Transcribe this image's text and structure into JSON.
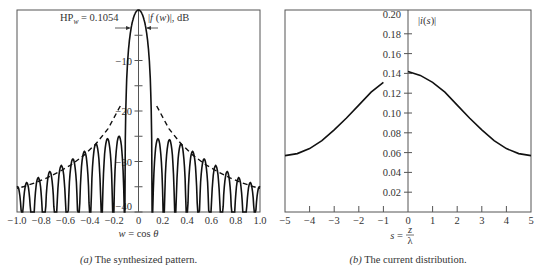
{
  "chart_data": [
    {
      "id": "a",
      "type": "line",
      "title": "",
      "caption_prefix": "(a)",
      "caption": " The synthesized pattern.",
      "xlabel": "w = cos θ",
      "ylabel": "|f (w)|, dB",
      "annotation": "HP_w = 0.1054",
      "xlim": [
        -1.0,
        1.0
      ],
      "ylim": [
        -40,
        0
      ],
      "xticks": [
        "-1.0",
        "-0.8",
        "-0.6",
        "-0.4",
        "-0.2",
        "0",
        "0.2",
        "0.4",
        "0.6",
        "0.8",
        "1.0"
      ],
      "yticks": [
        {
          "value": -10,
          "label": "-10"
        },
        {
          "value": -20,
          "label": "-20"
        },
        {
          "value": -30,
          "label": "-30"
        },
        {
          "value": -40,
          "label": "-40"
        }
      ],
      "minor_yticks": [
        -5,
        -15,
        -25,
        -35
      ],
      "grid": false,
      "main_lobe": {
        "first_null": 0.11,
        "peak_db": 0,
        "half_power_beamwidth": 0.1054
      },
      "sidelobes_right": {
        "centers": [
          0.16,
          0.255,
          0.35,
          0.445,
          0.54,
          0.635,
          0.73,
          0.825,
          0.92,
          0.995
        ],
        "peak_db": [
          -25.5,
          -25.7,
          -26.5,
          -28.0,
          -29.5,
          -30.8,
          -32.0,
          -33.2,
          -34.2,
          -35.0
        ]
      },
      "sidelobes_left": {
        "centers": [
          -0.16,
          -0.255,
          -0.35,
          -0.445,
          -0.54,
          -0.635,
          -0.73,
          -0.825,
          -0.92,
          -0.995
        ],
        "peak_db": [
          -25.0,
          -25.5,
          -26.5,
          -28.0,
          -29.5,
          -30.8,
          -32.0,
          -33.2,
          -34.2,
          -35.0
        ]
      },
      "envelope": {
        "style": "dashed",
        "x": [
          0.15,
          0.25,
          0.35,
          0.45,
          0.55,
          0.65,
          0.75,
          0.85,
          0.95,
          1.0
        ],
        "db": [
          -19.0,
          -23.5,
          -26.5,
          -28.8,
          -30.6,
          -32.0,
          -33.2,
          -34.2,
          -35.0,
          -35.3
        ]
      }
    },
    {
      "id": "b",
      "type": "line",
      "title": "",
      "caption_prefix": "(b)",
      "caption": " The current distribution.",
      "xlabel": "s = z/λ",
      "ylabel": "|i(s)|",
      "xlim": [
        -5,
        5
      ],
      "ylim": [
        0,
        0.2
      ],
      "xticks": [
        "-5",
        "-4",
        "-3",
        "-2",
        "-1",
        "0",
        "1",
        "2",
        "3",
        "4",
        "5"
      ],
      "yticks": [
        "0.02",
        "0.04",
        "0.06",
        "0.08",
        "0.10",
        "0.12",
        "0.14",
        "0.16",
        "0.18",
        "0.20"
      ],
      "grid": false,
      "x": [
        -5,
        -4.5,
        -4,
        -3.5,
        -3,
        -2.5,
        -2,
        -1.5,
        -1,
        -0.5,
        0,
        0.5,
        1,
        1.5,
        2,
        2.5,
        3,
        3.5,
        4,
        4.5,
        5
      ],
      "values": [
        0.057,
        0.059,
        0.064,
        0.072,
        0.083,
        0.095,
        0.108,
        0.121,
        0.131,
        0.138,
        0.142,
        0.138,
        0.131,
        0.121,
        0.108,
        0.095,
        0.083,
        0.072,
        0.064,
        0.059,
        0.057
      ]
    }
  ]
}
